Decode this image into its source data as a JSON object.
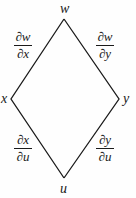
{
  "diagram": {
    "type": "tree-diagram (chain rule)",
    "nodes": {
      "top": "w",
      "left": "x",
      "right": "y",
      "bottom": "u"
    },
    "edges": [
      {
        "from": "w",
        "to": "x",
        "label_num": "∂w",
        "label_den": "∂x"
      },
      {
        "from": "w",
        "to": "y",
        "label_num": "∂w",
        "label_den": "∂y"
      },
      {
        "from": "x",
        "to": "u",
        "label_num": "∂x",
        "label_den": "∂u"
      },
      {
        "from": "y",
        "to": "u",
        "label_num": "∂y",
        "label_den": "∂u"
      }
    ],
    "line_color": "#1a1a1a"
  }
}
